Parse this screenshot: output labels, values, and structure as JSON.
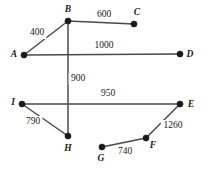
{
  "diagram": {
    "type": "weighted-undirected-graph",
    "width": 207,
    "height": 172,
    "background_color": "#ffffff",
    "edge_color": "#4a4a4a",
    "node_color": "#1a1a1a",
    "label_color": "#1a1a1a",
    "nodes": [
      {
        "id": "A",
        "label": "A",
        "x": 24,
        "y": 55,
        "label_x": 14,
        "label_y": 55
      },
      {
        "id": "B",
        "label": "B",
        "x": 68,
        "y": 21,
        "label_x": 68,
        "label_y": 10
      },
      {
        "id": "C",
        "label": "C",
        "x": 134,
        "y": 24,
        "label_x": 137,
        "label_y": 13
      },
      {
        "id": "D",
        "label": "D",
        "x": 180,
        "y": 54,
        "label_x": 190,
        "label_y": 55
      },
      {
        "id": "E",
        "label": "E",
        "x": 180,
        "y": 104,
        "label_x": 191,
        "label_y": 105
      },
      {
        "id": "F",
        "label": "F",
        "x": 146,
        "y": 138,
        "label_x": 153,
        "label_y": 146
      },
      {
        "id": "G",
        "label": "G",
        "x": 102,
        "y": 147,
        "label_x": 101,
        "label_y": 159
      },
      {
        "id": "H",
        "label": "H",
        "x": 68,
        "y": 136,
        "label_x": 68,
        "label_y": 149
      },
      {
        "id": "I",
        "label": "I",
        "x": 22,
        "y": 104,
        "label_x": 13,
        "label_y": 103
      }
    ],
    "edges": [
      {
        "id": "AB",
        "from": "A",
        "to": "B",
        "weight": "400",
        "label_x": 37,
        "label_y": 33
      },
      {
        "id": "BC",
        "from": "B",
        "to": "C",
        "weight": "600",
        "label_x": 104,
        "label_y": 15
      },
      {
        "id": "AD",
        "from": "A",
        "to": "D",
        "weight": "1000",
        "label_x": 104,
        "label_y": 46
      },
      {
        "id": "BH",
        "from": "B",
        "to": "H",
        "weight": "900",
        "label_x": 78,
        "label_y": 79
      },
      {
        "id": "IE",
        "from": "I",
        "to": "E",
        "weight": "950",
        "label_x": 108,
        "label_y": 94
      },
      {
        "id": "IH",
        "from": "I",
        "to": "H",
        "weight": "790",
        "label_x": 33,
        "label_y": 122
      },
      {
        "id": "GF",
        "from": "G",
        "to": "F",
        "weight": "740",
        "label_x": 125,
        "label_y": 152
      },
      {
        "id": "FE",
        "from": "F",
        "to": "E",
        "weight": "1260",
        "label_x": 173,
        "label_y": 126
      }
    ]
  }
}
